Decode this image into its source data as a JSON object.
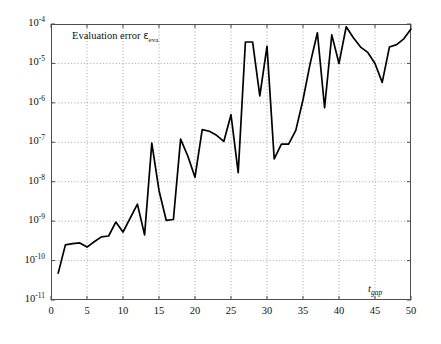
{
  "chart_data": {
    "type": "line",
    "title": "",
    "annotation_title": "Evaluation error",
    "annotation_symbol": "ε",
    "annotation_symbol_sub": "eva",
    "xlabel_symbol": "t",
    "xlabel_symbol_sub": "gap",
    "ylabel": "",
    "xlim": [
      0,
      50
    ],
    "ylim": [
      1e-11,
      0.0001
    ],
    "yscale": "log",
    "grid": true,
    "grid_style": "dotted",
    "legend": "none",
    "line_color": "#000000",
    "line_width": 1.6,
    "xticks": [
      0,
      5,
      10,
      15,
      20,
      25,
      30,
      35,
      40,
      45,
      50
    ],
    "xtick_labels": [
      "0",
      "5",
      "10",
      "15",
      "20",
      "25",
      "30",
      "35",
      "40",
      "45",
      "50"
    ],
    "yticks": [
      1e-11,
      1e-10,
      1e-09,
      1e-08,
      1e-07,
      1e-06,
      1e-05,
      0.0001
    ],
    "ytick_labels": [
      {
        "base": "10",
        "exp": "-11"
      },
      {
        "base": "10",
        "exp": "-10"
      },
      {
        "base": "10",
        "exp": "-9"
      },
      {
        "base": "10",
        "exp": "-8"
      },
      {
        "base": "10",
        "exp": "-7"
      },
      {
        "base": "10",
        "exp": "-6"
      },
      {
        "base": "10",
        "exp": "-5"
      },
      {
        "base": "10",
        "exp": "-4"
      }
    ],
    "x": [
      1,
      2,
      3,
      4,
      5,
      6,
      7,
      8,
      9,
      10,
      11,
      12,
      13,
      14,
      15,
      16,
      17,
      18,
      19,
      20,
      21,
      22,
      23,
      24,
      25,
      26,
      27,
      28,
      29,
      30,
      31,
      32,
      33,
      34,
      35,
      36,
      37,
      38,
      39,
      40,
      41,
      42,
      43,
      44,
      45,
      46,
      47,
      48,
      49,
      50
    ],
    "values": [
      4.8e-11,
      2.5e-10,
      2.7e-10,
      2.8e-10,
      2.2e-10,
      3e-10,
      4e-10,
      4.2e-10,
      9.5e-10,
      5.3e-10,
      1.2e-09,
      2.7e-09,
      4.5e-10,
      9.5e-08,
      6e-09,
      1.05e-09,
      1.1e-09,
      1.2e-07,
      4.5e-08,
      1.3e-08,
      2.1e-07,
      1.9e-07,
      1.5e-07,
      1.05e-07,
      5e-07,
      1.7e-08,
      3.5e-05,
      3.5e-05,
      1.5e-06,
      2.7e-05,
      3.8e-08,
      9e-08,
      9e-08,
      2e-07,
      1.2e-06,
      1e-05,
      6e-05,
      7.5e-07,
      5.3e-05,
      1e-05,
      8.5e-05,
      4.5e-05,
      2.6e-05,
      1.9e-05,
      1e-05,
      3.3e-06,
      2.6e-05,
      3e-05,
      4.2e-05,
      7.5e-05
    ]
  },
  "axes": {
    "plot_left": 51,
    "plot_top": 24,
    "plot_right": 411,
    "plot_bottom": 300
  }
}
